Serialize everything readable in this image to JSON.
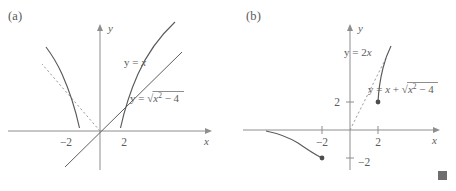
{
  "figure": {
    "panels": [
      {
        "id": "a",
        "label": "(a)",
        "axes": {
          "x_axis_name": "x",
          "y_axis_name": "y",
          "x_ticks": [
            "-2",
            "2"
          ],
          "y_ticks": []
        },
        "curves": [
          {
            "name": "line-y-equals-x",
            "label_html": "y = x",
            "label_plain": "y = x",
            "style": "solid"
          },
          {
            "name": "sqrt-curve",
            "label_html": "y = √(x² − 4)",
            "label_plain": "y = sqrt(x^2 - 4)",
            "style": "solid"
          },
          {
            "name": "asymptote-negative-x",
            "label_html": "",
            "label_plain": "y = -x",
            "style": "dashed"
          }
        ],
        "label_parts": {
          "line_lhs": "y = ",
          "line_rhs": "x",
          "sqrt_lhs": "y = ",
          "sqrt_radicand_base": "x",
          "sqrt_radicand_exp": "2",
          "sqrt_radicand_tail": " − 4"
        },
        "tick_left": "−2",
        "tick_right": "2"
      },
      {
        "id": "b",
        "label": "(b)",
        "axes": {
          "x_axis_name": "x",
          "y_axis_name": "y",
          "x_ticks": [
            "-2",
            "2"
          ],
          "y_ticks": [
            "2",
            "-2"
          ]
        },
        "curves": [
          {
            "name": "asymptote-two-x",
            "label_html": "y = 2x",
            "label_plain": "y = 2x",
            "style": "dashed"
          },
          {
            "name": "inverse-curve",
            "label_html": "y = x + √(x² − 4)",
            "label_plain": "y = x + sqrt(x^2 - 4)",
            "style": "solid"
          }
        ],
        "label_parts": {
          "asymptote_lhs": "y = 2",
          "asymptote_rhs": "x",
          "curve_lhs": "y = ",
          "curve_var": "x",
          "curve_plus": " + ",
          "curve_radicand_base": "x",
          "curve_radicand_exp": "2",
          "curve_radicand_tail": " − 4"
        },
        "tick_x_left": "−2",
        "tick_x_right": "2",
        "tick_y_up": "2",
        "tick_y_down": "−2",
        "points": [
          {
            "name": "point-2-2",
            "x": "2",
            "y": "2"
          },
          {
            "name": "point-minus2-minus2",
            "x": "-2",
            "y": "-2"
          }
        ]
      }
    ],
    "end_of_proof_marker": "■"
  }
}
